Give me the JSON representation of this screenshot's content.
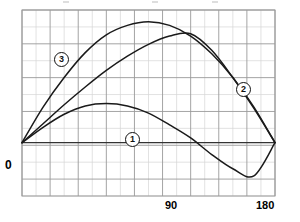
{
  "chart_data": {
    "type": "line",
    "title": "",
    "xlabel": "",
    "ylabel": "",
    "xlim": [
      0,
      180
    ],
    "ylim": [
      -0.45,
      1.12
    ],
    "grid": true,
    "grid_columns": 18,
    "grid_rows": 11,
    "legend_position": "inline-markers",
    "xticks": [
      0,
      90,
      180
    ],
    "xtick_labels": [
      "0",
      "90",
      "180"
    ],
    "yticks": [],
    "ytick_labels": [],
    "zero_line": 0,
    "series": [
      {
        "name": "1",
        "marker_label": "1",
        "x": [
          0,
          15,
          30,
          45,
          60,
          75,
          90,
          105,
          120,
          135,
          150,
          165,
          180
        ],
        "values": [
          0.0,
          0.13,
          0.24,
          0.31,
          0.33,
          0.31,
          0.25,
          0.15,
          0.04,
          -0.1,
          -0.22,
          -0.28,
          0.0
        ]
      },
      {
        "name": "2",
        "marker_label": "2",
        "x": [
          0,
          15,
          30,
          45,
          60,
          75,
          90,
          105,
          120,
          135,
          150,
          165,
          180
        ],
        "values": [
          0.0,
          0.16,
          0.32,
          0.47,
          0.61,
          0.73,
          0.83,
          0.9,
          0.92,
          0.78,
          0.55,
          0.29,
          0.0
        ]
      },
      {
        "name": "3",
        "marker_label": "3",
        "x": [
          0,
          15,
          30,
          45,
          60,
          75,
          90,
          105,
          120,
          135,
          150,
          165,
          180
        ],
        "values": [
          0.0,
          0.3,
          0.55,
          0.76,
          0.91,
          0.99,
          1.02,
          0.99,
          0.9,
          0.75,
          0.55,
          0.3,
          0.0
        ]
      }
    ],
    "colors": {
      "curve": "#1a1a1a",
      "grid_minor": "#d6d6d6",
      "grid_major": "#9a9a9a",
      "axis": "#333333",
      "background": "#ffffff"
    }
  },
  "axis": {
    "x_zero": "0",
    "x_mid": "90",
    "x_max": "180"
  },
  "markers": {
    "one": "1",
    "two": "2",
    "three": "3"
  }
}
